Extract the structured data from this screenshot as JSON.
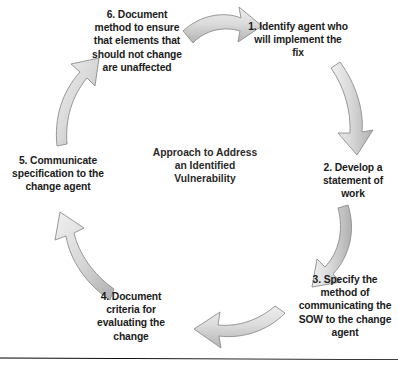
{
  "diagram": {
    "center_caption": "Approach to Address an Identified Vulnerability",
    "steps": [
      {
        "number": "1",
        "label": "1. Identify agent who will implement the fix"
      },
      {
        "number": "2",
        "label": "2. Develop a statement of work"
      },
      {
        "number": "3",
        "label": "3. Specify the method of communicating the SOW to the change agent"
      },
      {
        "number": "4",
        "label": "4. Document criteria for evaluating the change"
      },
      {
        "number": "5",
        "label": "5. Communicate specification to the change agent"
      },
      {
        "number": "6",
        "label": "6. Document method to ensure that elements that should not change are unaffected"
      }
    ],
    "colors": {
      "background": "#ffffff",
      "text": "#1b1b1b",
      "arrow_fill_light": "#ededed",
      "arrow_fill_mid": "#d2d2d2",
      "arrow_fill_dark": "#b4b4b4",
      "arrow_outline": "#8a8a8a",
      "rule": "#000000"
    }
  }
}
